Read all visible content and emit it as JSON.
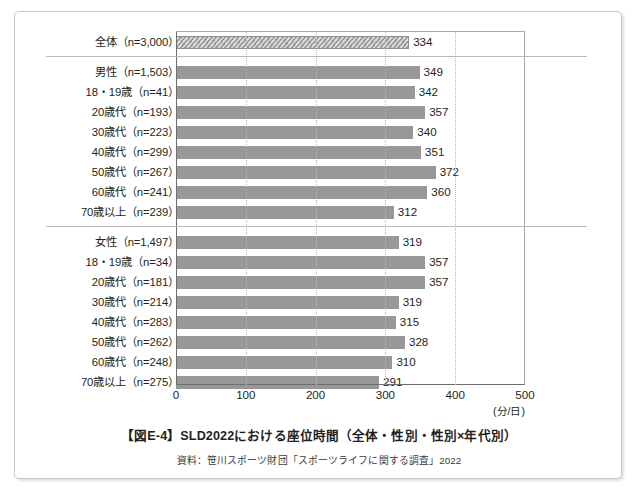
{
  "figure": {
    "title": "【図E-4】SLD2022における座位時間（全体・性別・性別×年代別）",
    "source": "資料：笹川スポーツ財団「スポーツライフに関する調査」2022",
    "unit": "(分/日)"
  },
  "colors": {
    "bar": "#989898",
    "hatch_light": "#d8d8d8",
    "frame": "#6d6d6d",
    "grid": "#b5b5b5",
    "text": "#231f20"
  },
  "chart_data": {
    "type": "bar",
    "orientation": "horizontal",
    "title": "【図E-4】SLD2022における座位時間（全体・性別・性別×年代別）",
    "xlabel": "(分/日)",
    "ylabel": "",
    "xlim": [
      0,
      500
    ],
    "xticks": [
      0,
      100,
      200,
      300,
      400,
      500
    ],
    "xticklabels": [
      "0",
      "100",
      "200",
      "300",
      "400",
      "500"
    ],
    "grid": true,
    "legend": "none",
    "groups": [
      {
        "name": "全体",
        "rows": [
          {
            "label": "全体（n=3,000）",
            "category": "全体",
            "n": "n=3,000",
            "value": 334,
            "style": "hatched"
          }
        ]
      },
      {
        "name": "男性",
        "rows": [
          {
            "label": "男性（n=1,503）",
            "category": "男性",
            "n": "n=1,503",
            "value": 349,
            "style": "solid"
          },
          {
            "label": "18・19歳（n=41）",
            "category": "18・19歳",
            "n": "n=41",
            "value": 342,
            "style": "solid"
          },
          {
            "label": "20歳代（n=193）",
            "category": "20歳代",
            "n": "n=193",
            "value": 357,
            "style": "solid"
          },
          {
            "label": "30歳代（n=223）",
            "category": "30歳代",
            "n": "n=223",
            "value": 340,
            "style": "solid"
          },
          {
            "label": "40歳代（n=299）",
            "category": "40歳代",
            "n": "n=299",
            "value": 351,
            "style": "solid"
          },
          {
            "label": "50歳代（n=267）",
            "category": "50歳代",
            "n": "n=267",
            "value": 372,
            "style": "solid"
          },
          {
            "label": "60歳代（n=241）",
            "category": "60歳代",
            "n": "n=241",
            "value": 360,
            "style": "solid"
          },
          {
            "label": "70歳以上（n=239）",
            "category": "70歳以上",
            "n": "n=239",
            "value": 312,
            "style": "solid"
          }
        ]
      },
      {
        "name": "女性",
        "rows": [
          {
            "label": "女性（n=1,497）",
            "category": "女性",
            "n": "n=1,497",
            "value": 319,
            "style": "solid"
          },
          {
            "label": "18・19歳（n=34）",
            "category": "18・19歳",
            "n": "n=34",
            "value": 357,
            "style": "solid"
          },
          {
            "label": "20歳代（n=181）",
            "category": "20歳代",
            "n": "n=181",
            "value": 357,
            "style": "solid"
          },
          {
            "label": "30歳代（n=214）",
            "category": "30歳代",
            "n": "n=214",
            "value": 319,
            "style": "solid"
          },
          {
            "label": "40歳代（n=283）",
            "category": "40歳代",
            "n": "n=283",
            "value": 315,
            "style": "solid"
          },
          {
            "label": "50歳代（n=262）",
            "category": "50歳代",
            "n": "n=262",
            "value": 328,
            "style": "solid"
          },
          {
            "label": "60歳代（n=248）",
            "category": "60歳代",
            "n": "n=248",
            "value": 310,
            "style": "solid"
          },
          {
            "label": "70歳以上（n=275）",
            "category": "70歳以上",
            "n": "n=275",
            "value": 291,
            "style": "solid"
          }
        ]
      }
    ],
    "categories": [
      "全体（n=3,000）",
      "男性（n=1,503）",
      "18・19歳（n=41）",
      "20歳代（n=193）",
      "30歳代（n=223）",
      "40歳代（n=299）",
      "50歳代（n=267）",
      "60歳代（n=241）",
      "70歳以上（n=239）",
      "女性（n=1,497）",
      "18・19歳（n=34）",
      "20歳代（n=181）",
      "30歳代（n=214）",
      "40歳代（n=283）",
      "50歳代（n=262）",
      "60歳代（n=248）",
      "70歳以上（n=275）"
    ],
    "values": [
      334,
      349,
      342,
      357,
      340,
      351,
      372,
      360,
      312,
      319,
      357,
      357,
      319,
      315,
      328,
      310,
      291
    ]
  }
}
